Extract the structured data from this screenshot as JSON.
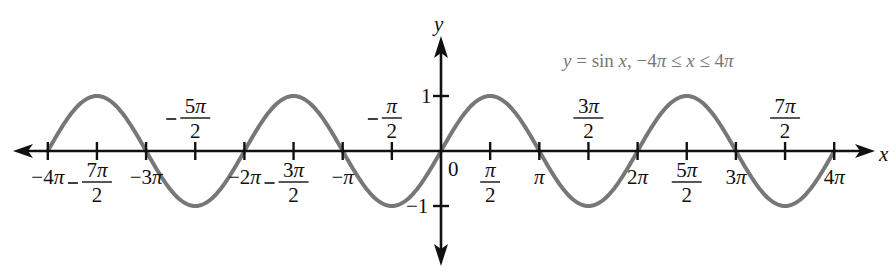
{
  "chart_data": {
    "type": "line",
    "title": "y = sin x, −4π ≤ x ≤ 4π",
    "function": "sin(x)",
    "xlabel": "x",
    "ylabel": "y",
    "xlim": [
      -12.566,
      12.566
    ],
    "ylim": [
      -1,
      1
    ],
    "grid": false,
    "legend": null,
    "x_ticks": [
      {
        "value": -12.566,
        "label": "−4π",
        "pos": "below"
      },
      {
        "value": -10.996,
        "label": "−7π/2",
        "pos": "below"
      },
      {
        "value": -9.425,
        "label": "−3π",
        "pos": "below"
      },
      {
        "value": -7.854,
        "label": "−5π/2",
        "pos": "above"
      },
      {
        "value": -6.283,
        "label": "−2π",
        "pos": "below"
      },
      {
        "value": -4.712,
        "label": "−3π/2",
        "pos": "below"
      },
      {
        "value": -3.142,
        "label": "−π",
        "pos": "below"
      },
      {
        "value": -1.571,
        "label": "−π/2",
        "pos": "above"
      },
      {
        "value": 0,
        "label": "0",
        "pos": "below"
      },
      {
        "value": 1.571,
        "label": "π/2",
        "pos": "below"
      },
      {
        "value": 3.142,
        "label": "π",
        "pos": "below"
      },
      {
        "value": 4.712,
        "label": "3π/2",
        "pos": "above"
      },
      {
        "value": 6.283,
        "label": "2π",
        "pos": "below"
      },
      {
        "value": 7.854,
        "label": "5π/2",
        "pos": "below"
      },
      {
        "value": 9.425,
        "label": "3π",
        "pos": "below"
      },
      {
        "value": 10.996,
        "label": "7π/2",
        "pos": "above"
      },
      {
        "value": 12.566,
        "label": "4π",
        "pos": "below"
      }
    ],
    "y_ticks": [
      {
        "value": 1,
        "label": "1"
      },
      {
        "value": -1,
        "label": "−1"
      }
    ],
    "series": [
      {
        "name": "y = sin x",
        "color": "#777777",
        "x": [
          "−4π",
          "−7π/2",
          "−3π",
          "−5π/2",
          "−2π",
          "−3π/2",
          "−π",
          "−π/2",
          "0",
          "π/2",
          "π",
          "3π/2",
          "2π",
          "5π/2",
          "3π",
          "7π/2",
          "4π"
        ],
        "values": [
          0,
          1,
          0,
          -1,
          0,
          1,
          0,
          -1,
          0,
          1,
          0,
          -1,
          0,
          1,
          0,
          -1,
          0
        ]
      }
    ]
  },
  "labels": {
    "title": "y = sin x, −4π ≤ x ≤ 4π",
    "x_axis": "x",
    "y_axis": "y",
    "origin": "0",
    "y_one": "1",
    "y_neg_one": "−1"
  },
  "colors": {
    "curve": "#777777",
    "axes": "#111111",
    "title": "#777777"
  }
}
